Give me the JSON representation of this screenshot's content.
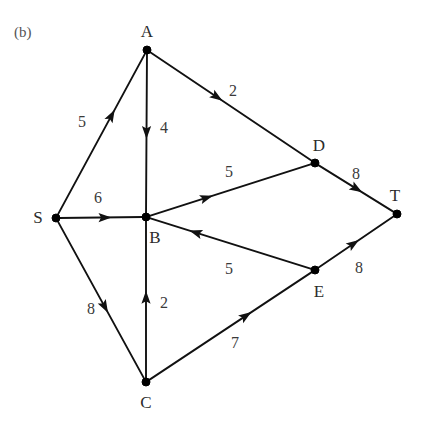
{
  "figure": {
    "caption": "(b)",
    "width": 425,
    "height": 426,
    "background_color": "#ffffff",
    "ink_color": "#111111"
  },
  "chart_data": {
    "type": "diagram",
    "subtype": "directed-weighted-graph",
    "title": "(b)",
    "directed": true,
    "nodes": [
      {
        "id": "S",
        "label": "S",
        "x": 56,
        "y": 218,
        "label_x": 38,
        "label_y": 217
      },
      {
        "id": "A",
        "label": "A",
        "x": 147,
        "y": 50,
        "label_x": 147,
        "label_y": 31
      },
      {
        "id": "B",
        "label": "B",
        "x": 146,
        "y": 217,
        "label_x": 155,
        "label_y": 237
      },
      {
        "id": "C",
        "label": "C",
        "x": 146,
        "y": 382,
        "label_x": 146,
        "label_y": 402
      },
      {
        "id": "D",
        "label": "D",
        "x": 315,
        "y": 163,
        "label_x": 319,
        "label_y": 145
      },
      {
        "id": "E",
        "label": "E",
        "x": 315,
        "y": 270,
        "label_x": 319,
        "label_y": 291
      },
      {
        "id": "T",
        "label": "T",
        "x": 397,
        "y": 214,
        "label_x": 395,
        "label_y": 195
      }
    ],
    "edges": [
      {
        "from": "S",
        "to": "A",
        "weight": 5,
        "label": "5",
        "label_x": 82,
        "label_y": 122,
        "arrow_t": 0.62
      },
      {
        "from": "A",
        "to": "B",
        "weight": 4,
        "label": "4",
        "label_x": 164,
        "label_y": 128,
        "arrow_t": 0.5
      },
      {
        "from": "A",
        "to": "D",
        "weight": 2,
        "label": "2",
        "label_x": 233,
        "label_y": 91,
        "arrow_t": 0.42
      },
      {
        "from": "S",
        "to": "B",
        "weight": 6,
        "label": "6",
        "label_x": 98,
        "label_y": 198,
        "arrow_t": 0.56
      },
      {
        "from": "B",
        "to": "D",
        "weight": 5,
        "label": "5",
        "label_x": 229,
        "label_y": 172,
        "arrow_t": 0.36
      },
      {
        "from": "D",
        "to": "T",
        "weight": 8,
        "label": "8",
        "label_x": 356,
        "label_y": 174,
        "arrow_t": 0.52
      },
      {
        "from": "S",
        "to": "C",
        "weight": 8,
        "label": "8",
        "label_x": 91,
        "label_y": 309,
        "arrow_t": 0.55
      },
      {
        "from": "C",
        "to": "B",
        "weight": 2,
        "label": "2",
        "label_x": 164,
        "label_y": 303,
        "arrow_t": 0.52
      },
      {
        "from": "C",
        "to": "E",
        "weight": 7,
        "label": "7",
        "label_x": 235,
        "label_y": 343,
        "arrow_t": 0.6
      },
      {
        "from": "E",
        "to": "B",
        "weight": 5,
        "label": "5",
        "label_x": 229,
        "label_y": 269,
        "arrow_t": 0.72
      },
      {
        "from": "E",
        "to": "T",
        "weight": 8,
        "label": "8",
        "label_x": 359,
        "label_y": 268,
        "arrow_t": 0.48
      }
    ],
    "node_count": 7,
    "edge_count": 11,
    "source_node": "S",
    "sink_node": "T"
  }
}
